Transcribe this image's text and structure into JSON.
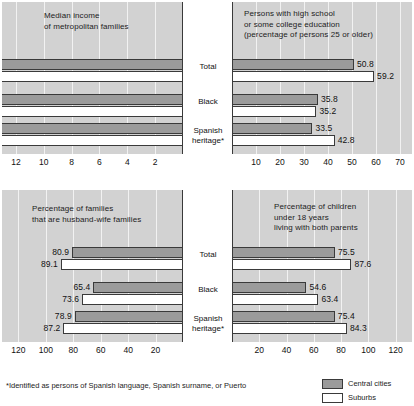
{
  "figure": {
    "footnote": "*Identified as persons of Spanish language, Spanish surname, or Puerto",
    "categories": [
      "Total",
      "Black",
      "Spanish\nheritage*"
    ],
    "legend": [
      {
        "label": "Central cities",
        "key": "central",
        "color": "#9b9b9b"
      },
      {
        "label": "Suburbs",
        "key": "suburbs",
        "color": "#ffffff"
      }
    ]
  },
  "chart_data": [
    {
      "id": "median-income",
      "type": "bar",
      "orientation": "horizontal-left",
      "title": "Median income\nof metropolitan families",
      "title_lines": [
        "Median income",
        "of metropolitan families"
      ],
      "categories": [
        "Total",
        "Black",
        "Spanish heritage*"
      ],
      "series": [
        {
          "name": "Central cities",
          "values": [
            9510,
            6790,
            7190
          ],
          "labels": [
            "$9,510",
            "$6,790",
            "$7,190"
          ]
        },
        {
          "name": "Suburbs",
          "values": [
            11210,
            7000,
            8960
          ],
          "labels": [
            "11,210",
            "7,000",
            "8,960"
          ]
        }
      ],
      "xlabel": "",
      "ylabel": "",
      "tick_labels": [
        "12",
        "10",
        "8",
        "6",
        "4",
        "2"
      ],
      "tick_values": [
        12,
        10,
        8,
        6,
        4,
        2
      ],
      "axis_units": "thousands of dollars",
      "xlim": [
        0,
        13
      ],
      "grid": true
    },
    {
      "id": "high-school-education",
      "type": "bar",
      "orientation": "horizontal-right",
      "title": "Persons with high school\nor some college education\n(percentage of persons 25 or older)",
      "title_lines": [
        "Persons with high school",
        "or some college education",
        "(percentage of persons 25 or older)"
      ],
      "categories": [
        "Total",
        "Black",
        "Spanish heritage*"
      ],
      "series": [
        {
          "name": "Central cities",
          "values": [
            50.8,
            35.8,
            33.5
          ],
          "labels": [
            "50.8",
            "35.8",
            "33.5"
          ]
        },
        {
          "name": "Suburbs",
          "values": [
            59.2,
            35.2,
            42.8
          ],
          "labels": [
            "59.2",
            "35.2",
            "42.8"
          ]
        }
      ],
      "xlabel": "",
      "ylabel": "",
      "tick_labels": [
        "10",
        "20",
        "30",
        "40",
        "50",
        "60",
        "70"
      ],
      "tick_values": [
        10,
        20,
        30,
        40,
        50,
        60,
        70
      ],
      "axis_units": "percent",
      "xlim": [
        0,
        75
      ],
      "grid": true
    },
    {
      "id": "husband-wife-families",
      "type": "bar",
      "orientation": "horizontal-left",
      "title": "Percentage of families\nthat are husband-wife families",
      "title_lines": [
        "Percentage of families",
        "that are husband–wife families"
      ],
      "categories": [
        "Total",
        "Black",
        "Spanish heritage*"
      ],
      "series": [
        {
          "name": "Central cities",
          "values": [
            80.9,
            65.4,
            78.9
          ],
          "labels": [
            "80.9",
            "65.4",
            "78.9"
          ]
        },
        {
          "name": "Suburbs",
          "values": [
            89.1,
            73.6,
            87.2
          ],
          "labels": [
            "89.1",
            "73.6",
            "87.2"
          ]
        }
      ],
      "xlabel": "",
      "ylabel": "",
      "tick_labels": [
        "120",
        "100",
        "80",
        "60",
        "40",
        "20"
      ],
      "tick_values": [
        120,
        100,
        80,
        60,
        40,
        20
      ],
      "axis_units": "percent",
      "xlim": [
        0,
        132
      ],
      "grid": true
    },
    {
      "id": "children-both-parents",
      "type": "bar",
      "orientation": "horizontal-right",
      "title": "Percentage of children\nunder 18 years\nliving with both parents",
      "title_lines": [
        "Percentage of children",
        "under 18 years",
        "living with both parents"
      ],
      "categories": [
        "Total",
        "Black",
        "Spanish heritage*"
      ],
      "series": [
        {
          "name": "Central cities",
          "values": [
            75.5,
            54.6,
            75.4
          ],
          "labels": [
            "75.5",
            "54.6",
            "75.4"
          ]
        },
        {
          "name": "Suburbs",
          "values": [
            87.6,
            63.4,
            84.3
          ],
          "labels": [
            "87.6",
            "63.4",
            "84.3"
          ]
        }
      ],
      "xlabel": "",
      "ylabel": "",
      "tick_labels": [
        "20",
        "40",
        "60",
        "80",
        "100",
        "120"
      ],
      "tick_values": [
        20,
        40,
        60,
        80,
        100,
        120
      ],
      "axis_units": "percent",
      "xlim": [
        0,
        132
      ],
      "grid": true
    }
  ]
}
